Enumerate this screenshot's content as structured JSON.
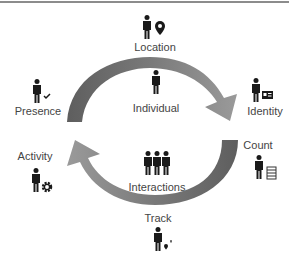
{
  "diagram": {
    "title": "",
    "center_top": {
      "label": "Individual",
      "icon": "person-icon"
    },
    "center_bottom": {
      "label": "Interactions",
      "icon": "group-of-three-people-icon"
    },
    "nodes": [
      {
        "id": "location",
        "label": "Location",
        "icon": "person-with-map-pin-icon"
      },
      {
        "id": "identity",
        "label": "Identity",
        "icon": "person-with-id-card-icon"
      },
      {
        "id": "count",
        "label": "Count",
        "icon": "person-with-abacus-icon"
      },
      {
        "id": "track",
        "label": "Track",
        "icon": "person-with-path-pins-icon"
      },
      {
        "id": "activity",
        "label": "Activity",
        "icon": "person-with-gear-icon"
      },
      {
        "id": "presence",
        "label": "Presence",
        "icon": "person-with-checkmark-icon"
      }
    ],
    "arrows": [
      {
        "from": "presence",
        "to": "identity",
        "direction": "clockwise-top",
        "color": "#7f7f7f"
      },
      {
        "from": "count",
        "to": "activity",
        "direction": "clockwise-bottom",
        "color": "#7f7f7f"
      }
    ],
    "colors": {
      "arrow_fill": "#808080",
      "arrow_dark": "#5a5a5a",
      "icon": "#1a1a1a",
      "text": "#444444",
      "rule": "#8c8c8c"
    }
  }
}
